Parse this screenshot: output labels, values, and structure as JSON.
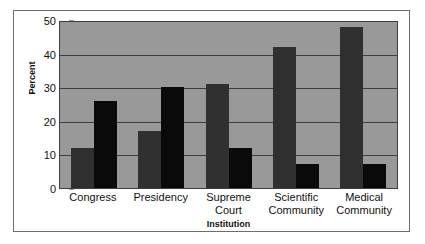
{
  "chart_data": {
    "type": "bar",
    "title": "",
    "xlabel": "Institution",
    "ylabel": "Percent",
    "categories": [
      "Congress",
      "Presidency",
      "Supreme\nCourt",
      "Scientific\nCommunity",
      "Medical\nCommunity"
    ],
    "yticks": [
      0,
      10,
      20,
      30,
      40,
      50
    ],
    "ylim": [
      0,
      50
    ],
    "grid": true,
    "legend": "none",
    "series": [
      {
        "name": "series-1",
        "color": "#303030",
        "values": [
          12,
          17,
          31,
          42,
          48
        ]
      },
      {
        "name": "series-2",
        "color": "#0a0a0a",
        "values": [
          26,
          30,
          12,
          7,
          7
        ]
      }
    ],
    "plot_background": "#999999",
    "figure_background": "#ffffff",
    "border_color": "#6d6d6d"
  }
}
